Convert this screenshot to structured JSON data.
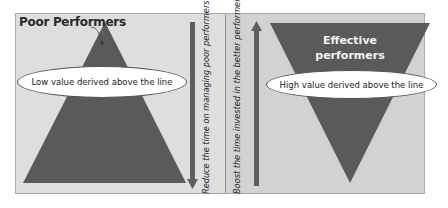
{
  "diagram": {
    "left_panel": {
      "title": "Poor Performers",
      "shape": "upright-triangle",
      "ellipse_label": "Low value derived above the line",
      "arrow_direction": "down",
      "arrow_label": "Reduce the time on managing poor performers"
    },
    "right_panel": {
      "title": "Effective performers",
      "title_line1": "Effective",
      "title_line2": "performers",
      "shape": "inverted-triangle",
      "ellipse_label": "High value derived above the line",
      "arrow_direction": "up",
      "arrow_label": "Boost the time invested in the better performers"
    },
    "colors": {
      "triangle_fill": "#5a5a5a",
      "arrow_fill": "#5e5e5e",
      "left_background": "#dedede",
      "right_background": "#d2d2d2",
      "ellipse_fill": "#ffffff"
    }
  }
}
